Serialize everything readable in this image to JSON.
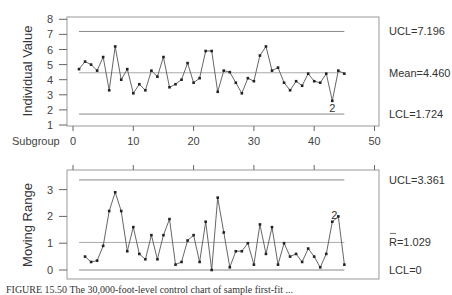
{
  "chart_data": [
    {
      "type": "line",
      "title": "",
      "xlabel": "Subgroup",
      "ylabel": "Individual Value",
      "x_ticks": [
        "0",
        "10",
        "20",
        "30",
        "40",
        "50"
      ],
      "y_ticks": [
        "1",
        "2",
        "3",
        "4",
        "5",
        "6",
        "7",
        "8"
      ],
      "xlim": [
        0,
        50
      ],
      "ylim": [
        1,
        8
      ],
      "grid": false,
      "control_lines": {
        "ucl": {
          "value": 7.196,
          "label": "UCL=7.196"
        },
        "center": {
          "value": 4.46,
          "label": "Mean=4.460"
        },
        "lcl": {
          "value": 1.724,
          "label": "LCL=1.724"
        }
      },
      "annotations": [
        {
          "x": 43,
          "text": "2"
        }
      ],
      "x": [
        1,
        2,
        3,
        4,
        5,
        6,
        7,
        8,
        9,
        10,
        11,
        12,
        13,
        14,
        15,
        16,
        17,
        18,
        19,
        20,
        21,
        22,
        23,
        24,
        25,
        26,
        27,
        28,
        29,
        30,
        31,
        32,
        33,
        34,
        35,
        36,
        37,
        38,
        39,
        40,
        41,
        42,
        43,
        44,
        45
      ],
      "values": [
        4.7,
        5.2,
        5.0,
        4.6,
        5.5,
        3.3,
        6.2,
        4.0,
        4.7,
        3.1,
        3.7,
        3.3,
        4.6,
        4.2,
        5.5,
        3.5,
        3.7,
        4.0,
        5.1,
        3.8,
        4.1,
        5.9,
        5.9,
        3.2,
        4.6,
        4.5,
        3.8,
        3.1,
        4.1,
        3.9,
        5.6,
        6.2,
        4.6,
        4.8,
        3.8,
        3.3,
        3.9,
        3.6,
        4.4,
        3.9,
        3.8,
        4.4,
        2.6,
        4.6,
        4.4
      ]
    },
    {
      "type": "line",
      "title": "",
      "xlabel": "",
      "ylabel": "Moving Range",
      "y_ticks": [
        "0",
        "1",
        "2",
        "3"
      ],
      "xlim": [
        0,
        50
      ],
      "ylim": [
        -0.3,
        3.7
      ],
      "grid": false,
      "control_lines": {
        "ucl": {
          "value": 3.361,
          "label": "UCL=3.361"
        },
        "center": {
          "value": 1.029,
          "label": "R=1.029"
        },
        "lcl": {
          "value": 0,
          "label": "LCL=0"
        }
      },
      "annotations": [
        {
          "x": 43,
          "text": "2"
        }
      ],
      "x": [
        2,
        3,
        4,
        5,
        6,
        7,
        8,
        9,
        10,
        11,
        12,
        13,
        14,
        15,
        16,
        17,
        18,
        19,
        20,
        21,
        22,
        23,
        24,
        25,
        26,
        27,
        28,
        29,
        30,
        31,
        32,
        33,
        34,
        35,
        36,
        37,
        38,
        39,
        40,
        41,
        42,
        43,
        44,
        45
      ],
      "values": [
        0.5,
        0.3,
        0.35,
        0.9,
        2.2,
        2.9,
        2.2,
        0.7,
        1.6,
        0.6,
        0.4,
        1.3,
        0.4,
        1.3,
        1.9,
        0.2,
        0.3,
        1.1,
        1.3,
        0.3,
        1.8,
        0.0,
        2.7,
        1.4,
        0.1,
        0.7,
        0.7,
        1.0,
        0.2,
        1.7,
        0.6,
        1.6,
        0.2,
        1.0,
        0.5,
        0.6,
        0.3,
        0.8,
        0.5,
        0.1,
        0.6,
        1.8,
        2.0,
        0.2
      ]
    }
  ],
  "caption": "FIGURE 15.50   The 30,000-foot-level control chart of sample first-fit ..."
}
